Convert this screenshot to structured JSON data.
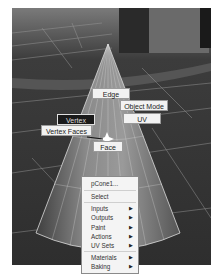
{
  "viewport": {
    "background_color": "#3a3a3a",
    "object_name": "pCone1"
  },
  "marking_menu": {
    "items": [
      {
        "label": "Edge",
        "position": "north"
      },
      {
        "label": "Object Mode",
        "position": "northeast"
      },
      {
        "label": "UV",
        "position": "east"
      },
      {
        "label": "Vertex",
        "position": "west",
        "highlighted": true
      },
      {
        "label": "Vertex Faces",
        "position": "southwest"
      },
      {
        "label": "Face",
        "position": "south"
      }
    ]
  },
  "context_menu": {
    "title": "pCone1...",
    "items": [
      {
        "label": "Select",
        "submenu": false
      },
      {
        "label": "Inputs",
        "submenu": true
      },
      {
        "label": "Outputs",
        "submenu": true
      },
      {
        "label": "Paint",
        "submenu": true
      },
      {
        "label": "Actions",
        "submenu": true
      },
      {
        "label": "UV Sets",
        "submenu": true
      },
      {
        "label": "Materials",
        "submenu": true
      },
      {
        "label": "Baking",
        "submenu": true
      }
    ],
    "submenu_arrow": "▶"
  }
}
